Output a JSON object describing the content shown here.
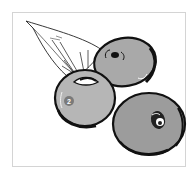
{
  "illustration": {
    "subject": "blueberries-with-leaf",
    "berry_count": 3,
    "marker_label": "2",
    "colors": {
      "frame_border": "#d4d4d4",
      "outline": "#111111",
      "berry_top": "#a9a9a9",
      "berry_left": "#b6b6b6",
      "berry_right": "#9c9c9c",
      "marker_fill": "#7a7a7a",
      "marker_text": "#ffffff",
      "leaf_fill": "#ffffff"
    }
  }
}
